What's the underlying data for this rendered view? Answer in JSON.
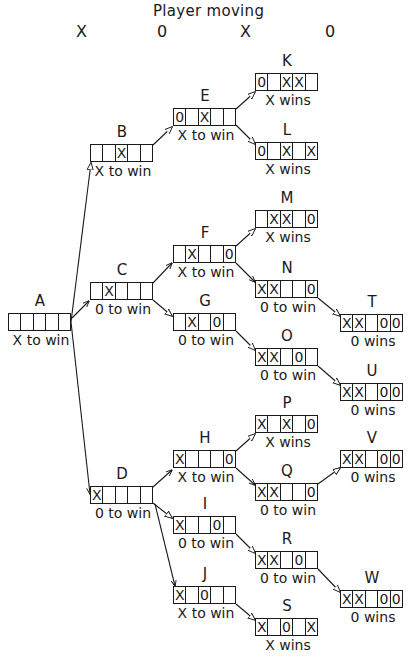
{
  "header": {
    "title": "Player moving",
    "columns": [
      "X",
      "0",
      "X",
      "0"
    ]
  },
  "nodes": {
    "A": {
      "label": "A",
      "cells": [
        "",
        "",
        "",
        "",
        ""
      ],
      "status": "X to win"
    },
    "B": {
      "label": "B",
      "cells": [
        "",
        "",
        "X",
        "",
        ""
      ],
      "status": "X to win"
    },
    "C": {
      "label": "C",
      "cells": [
        "",
        "X",
        "",
        "",
        ""
      ],
      "status": "0 to win"
    },
    "D": {
      "label": "D",
      "cells": [
        "X",
        "",
        "",
        "",
        ""
      ],
      "status": "0 to win"
    },
    "E": {
      "label": "E",
      "cells": [
        "0",
        "",
        "X",
        "",
        ""
      ],
      "status": "X to win"
    },
    "F": {
      "label": "F",
      "cells": [
        "",
        "X",
        "",
        "",
        "0"
      ],
      "status": "X to win"
    },
    "G": {
      "label": "G",
      "cells": [
        "",
        "X",
        "",
        "0",
        ""
      ],
      "status": "0 to win"
    },
    "H": {
      "label": "H",
      "cells": [
        "X",
        "",
        "",
        "",
        "0"
      ],
      "status": "X to win"
    },
    "I": {
      "label": "I",
      "cells": [
        "X",
        "",
        "",
        "0",
        ""
      ],
      "status": "0 to win"
    },
    "J": {
      "label": "J",
      "cells": [
        "X",
        "",
        "0",
        "",
        ""
      ],
      "status": "X to win"
    },
    "K": {
      "label": "K",
      "cells": [
        "0",
        "",
        "X",
        "X",
        ""
      ],
      "status": "X wins"
    },
    "L": {
      "label": "L",
      "cells": [
        "0",
        "",
        "X",
        "",
        "X"
      ],
      "status": "X wins"
    },
    "M": {
      "label": "M",
      "cells": [
        "",
        "X",
        "X",
        "",
        "0"
      ],
      "status": "X wins"
    },
    "N": {
      "label": "N",
      "cells": [
        "X",
        "X",
        "",
        "",
        "0"
      ],
      "status": "0 to win"
    },
    "O": {
      "label": "O",
      "cells": [
        "X",
        "X",
        "",
        "0",
        ""
      ],
      "status": "0 to win"
    },
    "P": {
      "label": "P",
      "cells": [
        "X",
        "",
        "X",
        "",
        "0"
      ],
      "status": "X wins"
    },
    "Q": {
      "label": "Q",
      "cells": [
        "X",
        "X",
        "",
        "",
        "0"
      ],
      "status": "0 to win"
    },
    "R": {
      "label": "R",
      "cells": [
        "X",
        "X",
        "",
        "0",
        ""
      ],
      "status": "0 to win"
    },
    "S": {
      "label": "S",
      "cells": [
        "X",
        "",
        "0",
        "",
        "X"
      ],
      "status": "X wins"
    },
    "T": {
      "label": "T",
      "cells": [
        "X",
        "X",
        "",
        "0",
        "0"
      ],
      "status": "0 wins"
    },
    "U": {
      "label": "U",
      "cells": [
        "X",
        "X",
        "",
        "0",
        "0"
      ],
      "status": "0 wins"
    },
    "V": {
      "label": "V",
      "cells": [
        "X",
        "X",
        "",
        "0",
        "0"
      ],
      "status": "0 wins"
    },
    "W": {
      "label": "W",
      "cells": [
        "X",
        "X",
        "",
        "0",
        "0"
      ],
      "status": "0 wins"
    }
  },
  "edges": [
    [
      "A",
      "B"
    ],
    [
      "A",
      "C"
    ],
    [
      "A",
      "D"
    ],
    [
      "B",
      "E"
    ],
    [
      "C",
      "F"
    ],
    [
      "C",
      "G"
    ],
    [
      "D",
      "H"
    ],
    [
      "D",
      "I"
    ],
    [
      "D",
      "J"
    ],
    [
      "E",
      "K"
    ],
    [
      "E",
      "L"
    ],
    [
      "F",
      "M"
    ],
    [
      "F",
      "N"
    ],
    [
      "G",
      "O"
    ],
    [
      "H",
      "P"
    ],
    [
      "H",
      "Q"
    ],
    [
      "I",
      "R"
    ],
    [
      "J",
      "S"
    ],
    [
      "N",
      "T"
    ],
    [
      "O",
      "U"
    ],
    [
      "Q",
      "V"
    ],
    [
      "R",
      "W"
    ]
  ]
}
